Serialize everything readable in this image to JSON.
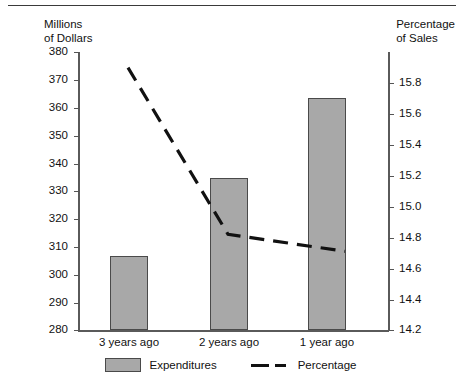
{
  "chart_data": {
    "type": "bar",
    "title": "",
    "subtitle": "",
    "categories": [
      "3 years ago",
      "2 years ago",
      "1 year ago"
    ],
    "series": [
      {
        "name": "Expenditures",
        "type": "bar",
        "axis": "left",
        "values": [
          306,
          333.5,
          362.5
        ]
      },
      {
        "name": "Percentage",
        "type": "line",
        "axis": "right",
        "style": "dashed",
        "values": [
          15.9,
          14.82,
          14.71
        ]
      }
    ],
    "xlabel": "",
    "ylabel": "Millions\nof Dollars",
    "y2label": "Percentage\nof Sales",
    "ylim": [
      280,
      380
    ],
    "y2lim": [
      14.2,
      15.9
    ],
    "yticks": [
      "380",
      "370",
      "360",
      "350",
      "340",
      "330",
      "320",
      "310",
      "300",
      "290",
      "280"
    ],
    "y2ticks": [
      "15.8",
      "15.6",
      "15.4",
      "15.2",
      "15.0",
      "14.8",
      "14.6",
      "14.4",
      "14.2"
    ],
    "grid": false,
    "legend_position": "bottom",
    "legend": [
      "Expenditures",
      "Percentage"
    ],
    "colors": {
      "bar_fill": "#a8a8a8",
      "bar_stroke": "#4a4a4a",
      "line": "#111111",
      "axis": "#5a5a5a",
      "background": "#ffffff"
    }
  },
  "axes": {
    "left_title": "Millions\nof Dollars",
    "right_title": "Percentage\nof Sales"
  },
  "ticks": {
    "left": [
      {
        "label": "380",
        "y": 52
      },
      {
        "label": "370",
        "y": 80
      },
      {
        "label": "360",
        "y": 108
      },
      {
        "label": "350",
        "y": 136
      },
      {
        "label": "340",
        "y": 164
      },
      {
        "label": "330",
        "y": 191
      },
      {
        "label": "320",
        "y": 219
      },
      {
        "label": "310",
        "y": 247
      },
      {
        "label": "300",
        "y": 275
      },
      {
        "label": "290",
        "y": 303
      },
      {
        "label": "280",
        "y": 330
      }
    ],
    "right": [
      {
        "label": "15.8",
        "y": 83
      },
      {
        "label": "15.6",
        "y": 114
      },
      {
        "label": "15.4",
        "y": 145
      },
      {
        "label": "15.2",
        "y": 176
      },
      {
        "label": "15.0",
        "y": 207
      },
      {
        "label": "14.8",
        "y": 238
      },
      {
        "label": "14.6",
        "y": 269
      },
      {
        "label": "14.4",
        "y": 300
      },
      {
        "label": "14.2",
        "y": 330
      }
    ]
  },
  "bars": [
    {
      "label": "3 years ago",
      "value": "306",
      "x": 110,
      "width": 38,
      "top": 256
    },
    {
      "label": "2 years ago",
      "value": "333.5",
      "x": 210,
      "width": 38,
      "top": 178
    },
    {
      "label": "1 year ago",
      "value": "362.5",
      "x": 308,
      "width": 38,
      "top": 98
    }
  ],
  "xlabels": [
    {
      "text": "3 years ago",
      "center": 129
    },
    {
      "text": "2 years ago",
      "center": 229
    },
    {
      "text": "1 year ago",
      "center": 327
    }
  ],
  "legend": {
    "expenditures": "Expenditures",
    "percentage": "Percentage"
  }
}
